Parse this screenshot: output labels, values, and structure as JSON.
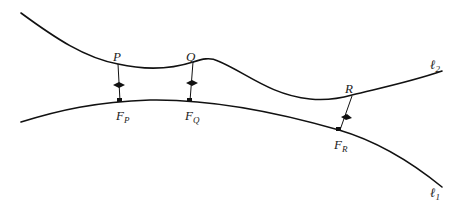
{
  "diagram": {
    "colors": {
      "stroke": "#111111",
      "text": "#222222",
      "background": "#ffffff"
    },
    "curves": [
      {
        "id": "l2",
        "label": "ℓ",
        "subscript": "2"
      },
      {
        "id": "l1",
        "label": "ℓ",
        "subscript": "1"
      }
    ],
    "points": [
      {
        "id": "P",
        "label": "P",
        "foot_label": "F",
        "foot_subscript": "P"
      },
      {
        "id": "Q",
        "label": "Q",
        "foot_label": "F",
        "foot_subscript": "Q"
      },
      {
        "id": "R",
        "label": "R",
        "foot_label": "F",
        "foot_subscript": "R"
      }
    ]
  }
}
